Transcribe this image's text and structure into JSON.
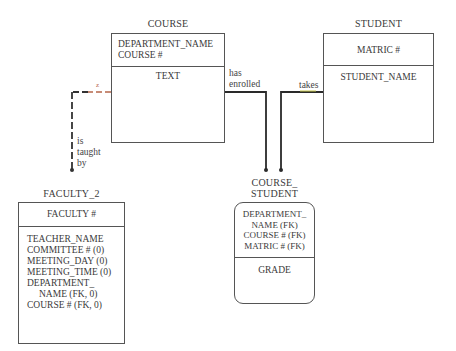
{
  "entities": {
    "course": {
      "title": "COURSE",
      "keys": [
        "DEPARTMENT_NAME",
        "COURSE #"
      ],
      "attributes": [
        "TEXT"
      ]
    },
    "student": {
      "title": "STUDENT",
      "keys": [
        "MATRIC #"
      ],
      "attributes": [
        "STUDENT_NAME"
      ]
    },
    "faculty_2": {
      "title": "FACULTY_2",
      "keys": [
        "FACULTY #"
      ],
      "attributes": [
        "TEACHER_NAME",
        "COMMITTEE # (0)",
        "MEETING_DAY (0)",
        "MEETING_TIME (0)",
        "DEPARTMENT_",
        "NAME (FK, 0)",
        "COURSE # (FK, 0)"
      ]
    },
    "course_student": {
      "title_line1": "COURSE_",
      "title_line2": "STUDENT",
      "keys": [
        "DEPARTMENT_",
        "NAME (FK)",
        "COURSE # (FK)",
        "MATRIC # (FK)"
      ],
      "attributes": [
        "GRADE"
      ]
    }
  },
  "relationships": {
    "has_enrolled": {
      "line1": "has",
      "line2": "enrolled"
    },
    "takes": {
      "label": "takes"
    },
    "is_taught_by": {
      "line1": "is",
      "line2": "taught",
      "line3": "by"
    },
    "marker": "z"
  },
  "colors": {
    "line": "#2a2a2a",
    "box_border": "#555555",
    "dash_accent": "#b5654a",
    "takes_accent": "#c9c94a"
  }
}
